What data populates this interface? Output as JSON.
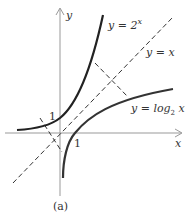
{
  "figure": {
    "caption": "(a)",
    "axes": {
      "x_label": "x",
      "y_label": "y",
      "x_tick": "1",
      "y_tick": "1"
    },
    "curves": [
      {
        "name": "exponential",
        "label_prefix": "y = 2",
        "label_sup": "x",
        "style": "solid"
      },
      {
        "name": "identity",
        "label": "y = x",
        "style": "dashed"
      },
      {
        "name": "logarithm",
        "label_prefix": "y = log",
        "label_sub": "2",
        "label_suffix": " x",
        "style": "solid"
      }
    ],
    "colors": {
      "axis": "#888888",
      "curve": "#222222",
      "dashed": "#333333",
      "text": "#333333"
    }
  }
}
